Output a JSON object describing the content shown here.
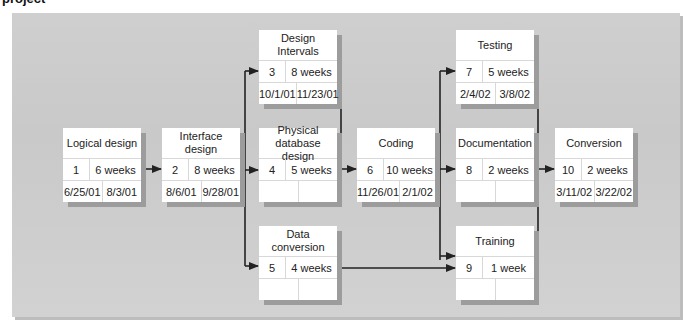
{
  "caption": "project",
  "tasks": [
    {
      "name": "Logical design",
      "id": "1",
      "duration": "6 weeks",
      "start": "6/25/01",
      "end": "8/3/01"
    },
    {
      "name": "Interface design",
      "id": "2",
      "duration": "8 weeks",
      "start": "8/6/01",
      "end": "9/28/01"
    },
    {
      "name": "Design Intervals",
      "id": "3",
      "duration": "8 weeks",
      "start": "10/1/01",
      "end": "11/23/01"
    },
    {
      "name": "Physical database design",
      "id": "4",
      "duration": "5 weeks",
      "start": "",
      "end": ""
    },
    {
      "name": "Data conversion",
      "id": "5",
      "duration": "4 weeks",
      "start": "",
      "end": ""
    },
    {
      "name": "Coding",
      "id": "6",
      "duration": "10 weeks",
      "start": "11/26/01",
      "end": "2/1/02"
    },
    {
      "name": "Testing",
      "id": "7",
      "duration": "5 weeks",
      "start": "2/4/02",
      "end": "3/8/02"
    },
    {
      "name": "Documentation",
      "id": "8",
      "duration": "2 weeks",
      "start": "",
      "end": ""
    },
    {
      "name": "Training",
      "id": "9",
      "duration": "1 week",
      "start": "",
      "end": ""
    },
    {
      "name": "Conversion",
      "id": "10",
      "duration": "2 weeks",
      "start": "3/11/02",
      "end": "3/22/02"
    }
  ],
  "dependencies": [
    [
      "1",
      "2"
    ],
    [
      "2",
      "3"
    ],
    [
      "2",
      "4"
    ],
    [
      "2",
      "5"
    ],
    [
      "3",
      "6"
    ],
    [
      "4",
      "6"
    ],
    [
      "6",
      "7"
    ],
    [
      "6",
      "8"
    ],
    [
      "6",
      "9"
    ],
    [
      "5",
      "9"
    ],
    [
      "7",
      "10"
    ],
    [
      "8",
      "10"
    ],
    [
      "9",
      "10"
    ]
  ]
}
